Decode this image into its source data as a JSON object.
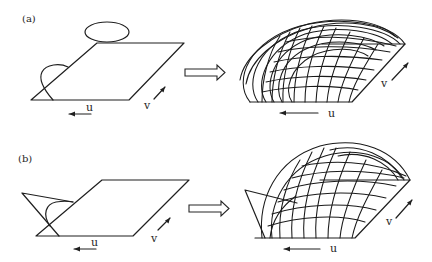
{
  "figure": {
    "panels": [
      {
        "id": "a",
        "label": "(a)",
        "before": {
          "u_label": "u",
          "v_label": "v"
        },
        "after": {
          "u_label": "u",
          "v_label": "v"
        },
        "transition_icon": "hollow-right-arrow"
      },
      {
        "id": "b",
        "label": "(b)",
        "before": {
          "u_label": "u",
          "v_label": "v"
        },
        "after": {
          "u_label": "u",
          "v_label": "v"
        },
        "transition_icon": "hollow-right-arrow"
      }
    ],
    "colors": {
      "ink": "#1f1f1f",
      "background": "#ffffff"
    }
  }
}
